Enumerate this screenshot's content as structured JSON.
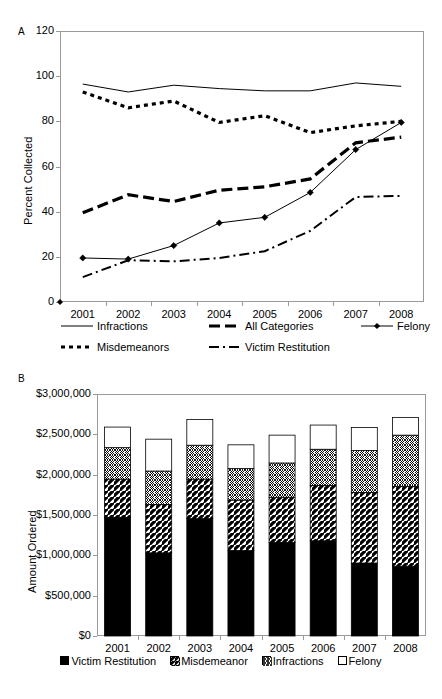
{
  "figure": {
    "panel_a_letter": "A",
    "panel_b_letter": "B"
  },
  "chart_data": [
    {
      "type": "line",
      "panel": "A",
      "title": "",
      "xlabel": "",
      "ylabel": "Percent Collected",
      "x": [
        "2001",
        "2002",
        "2003",
        "2004",
        "2005",
        "2006",
        "2007",
        "2008"
      ],
      "categories": [
        "2001",
        "2002",
        "2003",
        "2004",
        "2005",
        "2006",
        "2007",
        "2008"
      ],
      "ylim": [
        0,
        120
      ],
      "yticks": [
        0,
        20,
        40,
        60,
        80,
        100,
        120
      ],
      "ytick_labels": [
        "0",
        "20",
        "40",
        "60",
        "80",
        "100",
        "120"
      ],
      "grid": false,
      "legend_position": "bottom",
      "series": [
        {
          "name": "Infractions",
          "style": "thin-solid",
          "marker": "none",
          "values": [
            96.5,
            93.0,
            96.0,
            94.5,
            93.5,
            93.5,
            97.0,
            95.5
          ]
        },
        {
          "name": "All Categories",
          "style": "thick-dashed",
          "marker": "none",
          "values": [
            39.5,
            47.5,
            44.5,
            49.5,
            51.0,
            54.5,
            70.5,
            73.0
          ]
        },
        {
          "name": "Felony",
          "style": "thin-solid-marker",
          "marker": "diamond",
          "values": [
            19.5,
            19.0,
            25.0,
            35.0,
            37.5,
            48.5,
            67.5,
            79.5
          ]
        },
        {
          "name": "Misdemeanors",
          "style": "thick-dotted",
          "marker": "none",
          "values": [
            93.0,
            86.0,
            89.0,
            79.5,
            82.5,
            75.0,
            78.0,
            80.0
          ]
        },
        {
          "name": "Victim Restitution",
          "style": "dash-dot",
          "marker": "none",
          "values": [
            11.0,
            18.5,
            18.0,
            19.5,
            22.5,
            31.5,
            46.5,
            47.0
          ]
        }
      ],
      "legend": [
        "Infractions",
        "All Categories",
        "Felony",
        "Misdemeanors",
        "Victim Restitution"
      ]
    },
    {
      "type": "bar",
      "panel": "B",
      "stacked": true,
      "title": "",
      "xlabel": "",
      "ylabel": "Amount Ordered",
      "categories": [
        "2001",
        "2002",
        "2003",
        "2004",
        "2005",
        "2006",
        "2007",
        "2008"
      ],
      "ylim": [
        0,
        3000000
      ],
      "yticks": [
        0,
        500000,
        1000000,
        1500000,
        2000000,
        2500000,
        3000000
      ],
      "ytick_labels": [
        "$0",
        "$500,000",
        "$1,000,000",
        "$1,500,000",
        "$2,000,000",
        "$2,500,000",
        "$3,000,000"
      ],
      "grid": false,
      "legend_position": "bottom",
      "series": [
        {
          "name": "Victim Restitution",
          "pattern": "solid-black",
          "values": [
            1470000,
            1030000,
            1455000,
            1060000,
            1160000,
            1180000,
            905000,
            865000
          ]
        },
        {
          "name": "Misdemeanor",
          "pattern": "diagonal-hatch",
          "values": [
            475000,
            600000,
            490000,
            625000,
            560000,
            685000,
            875000,
            990000
          ]
        },
        {
          "name": "Infractions",
          "pattern": "cross-hatch",
          "values": [
            390000,
            415000,
            420000,
            390000,
            425000,
            450000,
            520000,
            635000
          ]
        },
        {
          "name": "Felony",
          "pattern": "white",
          "values": [
            255000,
            395000,
            320000,
            295000,
            345000,
            300000,
            285000,
            220000
          ]
        }
      ],
      "totals": [
        2590000,
        2440000,
        2685000,
        2370000,
        2490000,
        2615000,
        2585000,
        2710000
      ],
      "legend": [
        "Victim Restitution",
        "Misdemeanor",
        "Infractions",
        "Felony"
      ]
    }
  ],
  "panel_a": {
    "ylabel": "Percent Collected",
    "ytick_labels": [
      "120",
      "100",
      "80",
      "60",
      "40",
      "20",
      "0"
    ],
    "xtick_labels": [
      "2001",
      "2002",
      "2003",
      "2004",
      "2005",
      "2006",
      "2007",
      "2008"
    ],
    "legend": [
      {
        "label": "Infractions",
        "key": "thin-solid"
      },
      {
        "label": "All Categories",
        "key": "thick-dashed"
      },
      {
        "label": "Felony",
        "key": "thin-solid-marker"
      },
      {
        "label": "Misdemeanors",
        "key": "thick-dotted"
      },
      {
        "label": "Victim Restitution",
        "key": "dash-dot"
      }
    ]
  },
  "panel_b": {
    "ylabel": "Amount Ordered",
    "ytick_labels": [
      "$3,000,000",
      "$2,500,000",
      "$2,000,000",
      "$1,500,000",
      "$1,000,000",
      "$500,000",
      "$0"
    ],
    "xtick_labels": [
      "2001",
      "2002",
      "2003",
      "2004",
      "2005",
      "2006",
      "2007",
      "2008"
    ],
    "legend": [
      {
        "label": "Victim Restitution",
        "pattern": "solid-black"
      },
      {
        "label": "Misdemeanor",
        "pattern": "diagonal-hatch"
      },
      {
        "label": "Infractions",
        "pattern": "cross-hatch"
      },
      {
        "label": "Felony",
        "pattern": "white"
      }
    ]
  },
  "colors": {
    "line": "#000000",
    "axis": "#9a9a9a",
    "background": "#ffffff",
    "fill_solid": "#000000",
    "fill_white": "#ffffff"
  }
}
